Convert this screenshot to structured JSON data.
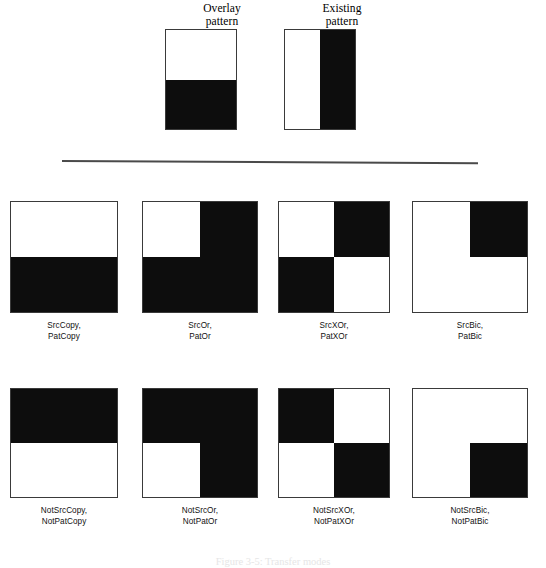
{
  "header": {
    "columns": [
      {
        "title": "Overlay\npattern",
        "title_line1": "Overlay",
        "title_line2": "pattern",
        "swatch": "top-white-bottom-black"
      },
      {
        "title": "Existing\npattern",
        "title_line1": "Existing",
        "title_line2": "pattern",
        "swatch": "left-white-right-black"
      }
    ]
  },
  "colors": {
    "ink": "#0d0d0d",
    "paper": "#ffffff",
    "border": "#3a3a3a",
    "divider": "#4a4a4a"
  },
  "patterns": {
    "overlay": {
      "top_left": false,
      "top_right": false,
      "bottom_left": true,
      "bottom_right": true
    },
    "existing": {
      "top_left": false,
      "top_right": true,
      "bottom_left": false,
      "bottom_right": true
    }
  },
  "results": {
    "rows": [
      {
        "cells": [
          {
            "label_line1": "SrcCopy,",
            "label_line2": "PatCopy",
            "quadrants": {
              "top_left": false,
              "top_right": false,
              "bottom_left": true,
              "bottom_right": true
            }
          },
          {
            "label_line1": "SrcOr,",
            "label_line2": "PatOr",
            "quadrants": {
              "top_left": false,
              "top_right": true,
              "bottom_left": true,
              "bottom_right": true
            }
          },
          {
            "label_line1": "SrcXOr,",
            "label_line2": "PatXOr",
            "quadrants": {
              "top_left": false,
              "top_right": true,
              "bottom_left": true,
              "bottom_right": false
            }
          },
          {
            "label_line1": "SrcBic,",
            "label_line2": "PatBic",
            "quadrants": {
              "top_left": false,
              "top_right": true,
              "bottom_left": false,
              "bottom_right": false
            }
          }
        ]
      },
      {
        "cells": [
          {
            "label_line1": "NotSrcCopy,",
            "label_line2": "NotPatCopy",
            "quadrants": {
              "top_left": true,
              "top_right": true,
              "bottom_left": false,
              "bottom_right": false
            }
          },
          {
            "label_line1": "NotSrcOr,",
            "label_line2": "NotPatOr",
            "quadrants": {
              "top_left": true,
              "top_right": true,
              "bottom_left": false,
              "bottom_right": true
            }
          },
          {
            "label_line1": "NotSrcXOr,",
            "label_line2": "NotPatXOr",
            "quadrants": {
              "top_left": true,
              "top_right": false,
              "bottom_left": false,
              "bottom_right": true
            }
          },
          {
            "label_line1": "NotSrcBic,",
            "label_line2": "NotPatBic",
            "quadrants": {
              "top_left": false,
              "top_right": false,
              "bottom_left": false,
              "bottom_right": true
            }
          }
        ]
      }
    ]
  },
  "caption": {
    "text": "Figure 3-5: Transfer modes"
  }
}
